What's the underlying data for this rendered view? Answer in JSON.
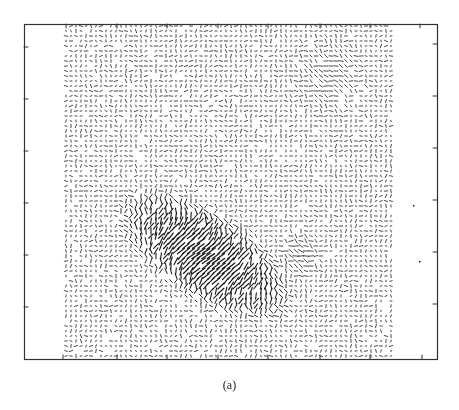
{
  "figure": {
    "caption": "(a)"
  },
  "chart_data": {
    "type": "quiver",
    "title": "",
    "xlabel": "",
    "ylabel": "",
    "caption": "(a)",
    "grid": false,
    "legend": null,
    "colors": {
      "axis": "#333333",
      "vectors": "#1a1a1a",
      "background": "#ffffff"
    },
    "frame_px": {
      "left": 24,
      "top": 24,
      "right": 437,
      "bottom": 359
    },
    "field_px": {
      "left": 66,
      "top": 26,
      "right": 393,
      "bottom": 356,
      "spacing": 5
    },
    "ticks_px": {
      "left_y": [
        47,
        99,
        151,
        203,
        255,
        307
      ],
      "right_y": [
        44,
        96,
        148,
        200,
        252,
        304
      ],
      "bottom_x": [
        63,
        117,
        167,
        218,
        268,
        320,
        370,
        422
      ],
      "top_x": [
        66,
        117,
        167,
        218,
        268,
        320,
        370,
        420
      ]
    },
    "tick_labels": [],
    "strong_flow_region": {
      "center_px": [
        205,
        255
      ],
      "semi_axes_px": [
        85,
        38
      ],
      "rotation_deg": 33,
      "segment_angle_deg": -33,
      "max_length_px": 11
    },
    "secondary_features": [
      {
        "center_px": [
          300,
          255
        ],
        "radius_px": 22,
        "segment_angle_deg": 0,
        "max_length_px": 7,
        "note": "horizontal streaks trailing to the right"
      },
      {
        "center_px": [
          330,
          75
        ],
        "radius_px": 40,
        "segment_angle_deg": 0,
        "max_length_px": 5,
        "note": "weak horizontal alignment upper-right"
      }
    ],
    "background_segment_length_px": 2.5,
    "stray_marks_px": [
      [
        413,
        205
      ],
      [
        419,
        261
      ]
    ]
  }
}
